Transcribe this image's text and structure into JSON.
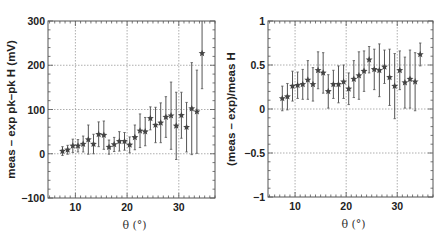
{
  "chart_data": [
    {
      "type": "scatter",
      "title": "",
      "xlabel": "θ (°)",
      "ylabel": "meas – exp pk–pk H (mV)",
      "xlim": [
        4.7,
        37
      ],
      "ylim": [
        -100,
        300
      ],
      "xticks": [
        10,
        20,
        30
      ],
      "xtick_labels": [
        "10",
        "20",
        "30"
      ],
      "yticks": [
        -100,
        0,
        100,
        200,
        300
      ],
      "ytick_labels": [
        "−100",
        "0",
        "100",
        "200",
        "300"
      ],
      "grid": true,
      "marker": "star",
      "x": [
        7.5,
        8.5,
        9.5,
        10.5,
        11.5,
        12.5,
        13.5,
        14.5,
        15.5,
        16.5,
        17.5,
        18.5,
        19.5,
        20.5,
        21.5,
        22.5,
        23.5,
        24.5,
        25.5,
        26.5,
        27.5,
        28.5,
        29.5,
        30.5,
        31.5,
        32.5,
        33.5,
        34.5
      ],
      "y": [
        6,
        9,
        18,
        18,
        22,
        32,
        22,
        44,
        42,
        15,
        21,
        28,
        28,
        20,
        37,
        52,
        50,
        80,
        65,
        70,
        83,
        86,
        63,
        87,
        60,
        102,
        95,
        227
      ],
      "yerr": [
        10,
        10,
        15,
        14,
        18,
        33,
        22,
        28,
        32,
        16,
        16,
        22,
        20,
        18,
        28,
        38,
        32,
        26,
        40,
        45,
        46,
        76,
        76,
        52,
        56,
        104,
        94,
        80
      ]
    },
    {
      "type": "scatter",
      "title": "",
      "xlabel": "θ (°)",
      "ylabel": "(meas – exp)/meas H",
      "xlim": [
        4.7,
        37
      ],
      "ylim": [
        -1,
        1
      ],
      "xticks": [
        10,
        20,
        30
      ],
      "xtick_labels": [
        "10",
        "20",
        "30"
      ],
      "yticks": [
        -1,
        -0.5,
        0,
        0.5,
        1
      ],
      "ytick_labels": [
        "−1",
        "−0.5",
        "0",
        "0.5",
        "1"
      ],
      "grid": true,
      "marker": "star",
      "x": [
        7.5,
        8.5,
        9.5,
        10.5,
        11.5,
        12.5,
        13.5,
        14.5,
        15.5,
        16.5,
        17.5,
        18.5,
        19.5,
        20.5,
        21.5,
        22.5,
        23.5,
        24.5,
        25.5,
        26.5,
        27.5,
        28.5,
        29.5,
        30.5,
        31.5,
        32.5,
        33.5,
        34.5
      ],
      "y": [
        0.12,
        0.14,
        0.26,
        0.27,
        0.28,
        0.33,
        0.28,
        0.44,
        0.41,
        0.2,
        0.28,
        0.28,
        0.31,
        0.23,
        0.34,
        0.38,
        0.43,
        0.56,
        0.45,
        0.44,
        0.48,
        0.36,
        0.26,
        0.44,
        0.3,
        0.34,
        0.31,
        0.62
      ],
      "yerr": [
        0.14,
        0.15,
        0.17,
        0.15,
        0.17,
        0.22,
        0.19,
        0.21,
        0.23,
        0.19,
        0.16,
        0.21,
        0.19,
        0.18,
        0.21,
        0.27,
        0.23,
        0.15,
        0.23,
        0.3,
        0.19,
        0.32,
        0.37,
        0.22,
        0.29,
        0.33,
        0.33,
        0.13
      ]
    }
  ],
  "layout": {
    "panels": [
      {
        "left": 48,
        "top": 21,
        "right": 215,
        "bottom": 198
      },
      {
        "left": 268,
        "top": 21,
        "right": 433,
        "bottom": 197
      }
    ],
    "colors": {
      "frame": "#555555",
      "grid": "#9a9a9a",
      "marker": "#444444",
      "errbar": "#555555",
      "text": "#222222"
    }
  }
}
